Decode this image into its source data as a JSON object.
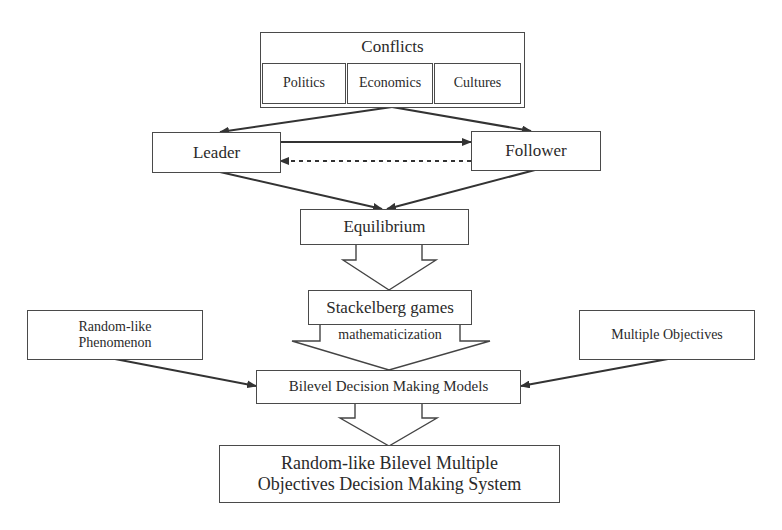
{
  "diagram": {
    "type": "flowchart",
    "nodes": {
      "conflicts": {
        "label": "Conflicts",
        "children": [
          "Politics",
          "Economics",
          "Cultures"
        ]
      },
      "leader": {
        "label": "Leader"
      },
      "follower": {
        "label": "Follower"
      },
      "equilibrium": {
        "label": "Equilibrium"
      },
      "stackelberg": {
        "label": "Stackelberg games"
      },
      "random_like": {
        "label_line1": "Random-like",
        "label_line2": "Phenomenon"
      },
      "multiple_objectives": {
        "label": "Multiple Objectives"
      },
      "bilevel": {
        "label": "Bilevel Decision Making Models"
      },
      "system": {
        "label_line1": "Random-like Bilevel Multiple",
        "label_line2": "Objectives Decision Making System"
      }
    },
    "edges": [
      {
        "from": "conflicts",
        "to": "leader",
        "style": "solid"
      },
      {
        "from": "conflicts",
        "to": "follower",
        "style": "solid"
      },
      {
        "from": "leader",
        "to": "follower",
        "style": "solid"
      },
      {
        "from": "follower",
        "to": "leader",
        "style": "dashed"
      },
      {
        "from": "leader",
        "to": "equilibrium",
        "style": "solid"
      },
      {
        "from": "follower",
        "to": "equilibrium",
        "style": "solid"
      },
      {
        "from": "equilibrium",
        "to": "stackelberg",
        "style": "hollow-block"
      },
      {
        "from": "stackelberg",
        "to": "bilevel",
        "style": "hollow-block",
        "label": "mathematicization"
      },
      {
        "from": "random_like",
        "to": "bilevel",
        "style": "solid"
      },
      {
        "from": "multiple_objectives",
        "to": "bilevel",
        "style": "solid"
      },
      {
        "from": "bilevel",
        "to": "system",
        "style": "hollow-block"
      }
    ],
    "colors": {
      "line": "#3a3a3a",
      "text": "#2a2a2a",
      "background": "#ffffff"
    }
  }
}
